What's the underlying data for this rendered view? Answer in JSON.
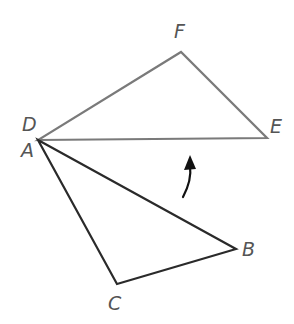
{
  "diagram": {
    "type": "geometry-rotation",
    "colors": {
      "background": "#ffffff",
      "image_triangle": "#7a7a7a",
      "preimage_triangle": "#2a2a2a",
      "arrow": "#111111",
      "label": "#555555"
    },
    "triangles": [
      {
        "name": "DEF",
        "role": "image",
        "vertices": {
          "D": [
            38,
            140
          ],
          "E": [
            267,
            138
          ],
          "F": [
            181,
            52
          ]
        }
      },
      {
        "name": "ABC",
        "role": "preimage",
        "vertices": {
          "A": [
            38,
            140
          ],
          "B": [
            236,
            249
          ],
          "C": [
            117,
            284
          ]
        }
      }
    ],
    "labels": {
      "F": "F",
      "D": "D",
      "E": "E",
      "A": "A",
      "B": "B",
      "C": "C"
    },
    "rotation_arrow": {
      "direction": "counterclockwise",
      "from": [
        183,
        197
      ],
      "to": [
        190,
        158
      ]
    }
  }
}
